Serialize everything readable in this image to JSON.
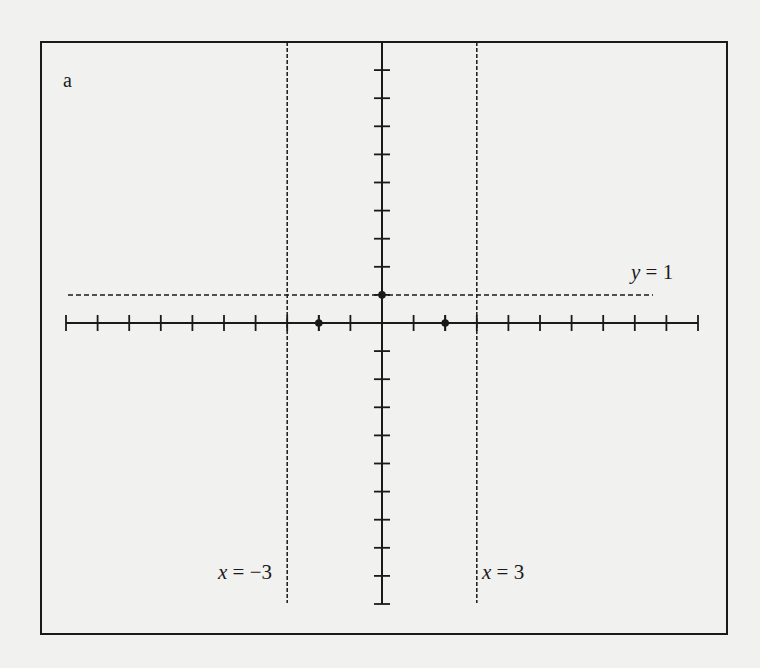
{
  "figure": {
    "panel_label": "a",
    "background": "#f1f1ef",
    "ink": "#1a1a1a"
  },
  "chart_data": {
    "type": "line",
    "title": "",
    "panel_label": "a",
    "xlabel": "",
    "ylabel": "",
    "grid": false,
    "legend": null,
    "x_axis": {
      "tick_step": 1,
      "min_tick": -10,
      "max_tick": 10,
      "tick_labels": []
    },
    "y_axis": {
      "tick_step": 1,
      "min_tick": -10,
      "max_tick": 10,
      "tick_labels": []
    },
    "asymptotes": [
      {
        "type": "vertical",
        "value": -3,
        "label_var": "x",
        "label_eq": " = ",
        "label_val": "−3",
        "style": "dashed"
      },
      {
        "type": "vertical",
        "value": 3,
        "label_var": "x",
        "label_eq": " = ",
        "label_val": "3",
        "style": "dashed"
      },
      {
        "type": "horizontal",
        "value": 1,
        "label_var": "y",
        "label_eq": " = ",
        "label_val": "1",
        "style": "dashed"
      }
    ],
    "points": [
      {
        "x": -2,
        "y": 0,
        "description": "x-intercept"
      },
      {
        "x": 2,
        "y": 0,
        "description": "x-intercept"
      },
      {
        "x": 0,
        "y": 1,
        "description": "y-intercept"
      }
    ]
  }
}
